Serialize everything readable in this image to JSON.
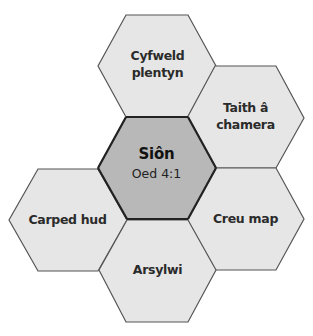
{
  "diagram": {
    "center": {
      "name": "Siôn",
      "age": "Oed 4:1",
      "fill": "#b8b8b8"
    },
    "nodes": [
      {
        "id": "top",
        "label_line1": "Cyfweld",
        "label_line2": "plentyn"
      },
      {
        "id": "top-right",
        "label_line1": "Taith â",
        "label_line2": "chamera"
      },
      {
        "id": "right",
        "label_line1": "Creu map",
        "label_line2": ""
      },
      {
        "id": "bottom",
        "label_line1": "Arsylwi",
        "label_line2": ""
      },
      {
        "id": "left",
        "label_line1": "Carped hud",
        "label_line2": ""
      }
    ],
    "colors": {
      "outer_fill": "#e6e6e6",
      "center_fill": "#b8b8b8",
      "border": "#555555",
      "text": "#2b2b2b"
    }
  }
}
